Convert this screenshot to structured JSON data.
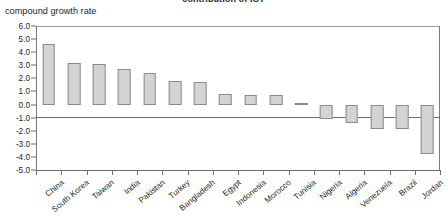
{
  "chart_data": {
    "type": "bar",
    "title": "contribution of ICT",
    "subtitle": "",
    "ylabel": "compound growth rate",
    "xlabel": "",
    "ylim": [
      -5.0,
      6.0
    ],
    "ytick_step": 1.0,
    "ytick_labels": [
      "6.0",
      "5.0",
      "4.0",
      "3.0",
      "2.0",
      "1.0",
      "0.0",
      "-1.0",
      "-2.0",
      "-3.0",
      "-4.0",
      "-5.0"
    ],
    "ytick_values": [
      6.0,
      5.0,
      4.0,
      3.0,
      2.0,
      1.0,
      0.0,
      -1.0,
      -2.0,
      -3.0,
      -4.0,
      -5.0
    ],
    "grid": false,
    "legend": "none",
    "bar_fill": "#d3d3d3",
    "bar_edge": "#8c8c8c",
    "axis_color": "#6e6e6e",
    "categories": [
      "China",
      "South Korea",
      "Taiwan",
      "India",
      "Pakistan",
      "Turkey",
      "Bangladesh",
      "Egypt",
      "Indonesia",
      "Morocco",
      "Tunisia",
      "Nigeria",
      "Algeria",
      "Venezuela",
      "Brazil",
      "Jordan"
    ],
    "values": [
      4.6,
      3.2,
      3.1,
      2.75,
      2.4,
      1.8,
      1.75,
      0.8,
      0.75,
      0.7,
      0.1,
      -1.1,
      -1.4,
      -1.9,
      -1.9,
      -3.8
    ]
  }
}
